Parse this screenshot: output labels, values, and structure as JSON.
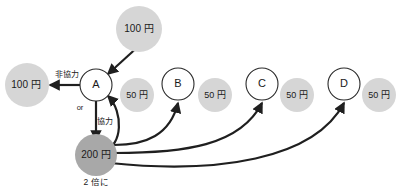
{
  "diagram": {
    "colors": {
      "stroke": "#1f1f1f",
      "node_fill": "#ffffff",
      "gray_light": "#d6d6d6",
      "gray_dark": "#a8a8a8",
      "text": "#1a1a1a"
    },
    "endowment_node": {
      "label": "100 円",
      "name": "endowment-100-yen"
    },
    "payoff_node": {
      "label": "100 円",
      "name": "payoff-100-yen"
    },
    "pot_node": {
      "label": "200 円",
      "caption": "2 倍に",
      "name": "pot-200-yen"
    },
    "players": [
      {
        "id": "A",
        "label": "A",
        "payout": "50 円"
      },
      {
        "id": "B",
        "label": "B",
        "payout": "50 円"
      },
      {
        "id": "C",
        "label": "C",
        "payout": "50 円"
      },
      {
        "id": "D",
        "label": "D",
        "payout": "50 円"
      }
    ],
    "edge_labels": {
      "defect": "非協力",
      "cooperate": "協力",
      "alternative": "or"
    }
  }
}
